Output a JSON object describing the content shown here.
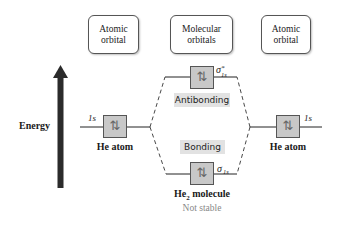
{
  "headers": {
    "left": {
      "line1": "Atomic",
      "line2": "orbital"
    },
    "middle": {
      "line1": "Molecular",
      "line2": "orbitals"
    },
    "right": {
      "line1": "Atomic",
      "line2": "orbital"
    }
  },
  "axis": {
    "label": "Energy",
    "icon": "up-arrow-icon"
  },
  "left_atom": {
    "orbital": "1s",
    "label": "He atom",
    "electrons": "⇅"
  },
  "right_atom": {
    "orbital": "1s",
    "label": "He atom",
    "electrons": "⇅"
  },
  "antibonding": {
    "symbol": "σ",
    "superscript": "*",
    "subscript": "1s",
    "tag": "Antibonding",
    "electrons": "⇅"
  },
  "bonding": {
    "symbol": "σ",
    "subscript": "1s",
    "tag": "Bonding",
    "electrons": "⇅"
  },
  "molecule": {
    "name_prefix": "He",
    "name_subscript": "2",
    "name_suffix": " molecule",
    "status": "Not stable"
  },
  "colors": {
    "box_fill": "#c8c8c8",
    "box_stroke": "#555555",
    "tag_bg": "#e2e2e2",
    "arrow": "#2b2b2b",
    "status_text": "#888888"
  }
}
